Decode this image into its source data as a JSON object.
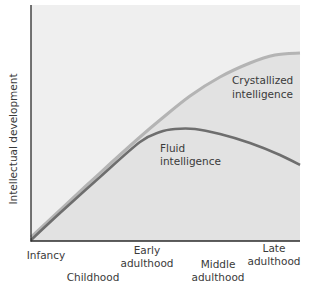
{
  "chart_data": {
    "type": "line",
    "title": "",
    "xlabel": "",
    "ylabel": "Intellectual development",
    "grid": false,
    "legend": "inline annotations",
    "categories": [
      "Infancy",
      "Childhood",
      "Early adulthood",
      "Middle adulthood",
      "Late adulthood"
    ],
    "x_tick_labels": [
      {
        "lines": [
          "Infancy"
        ],
        "x": 46,
        "y": 259
      },
      {
        "lines": [
          "Childhood"
        ],
        "x": 93,
        "y": 281
      },
      {
        "lines": [
          "Early",
          "adulthood"
        ],
        "x": 147,
        "y": 254
      },
      {
        "lines": [
          "Middle",
          "adulthood"
        ],
        "x": 218,
        "y": 268
      },
      {
        "lines": [
          "Late",
          "adulthood"
        ],
        "x": 274,
        "y": 252
      }
    ],
    "ylim": [
      0,
      100
    ],
    "series": [
      {
        "name": "Crystallized intelligence",
        "label_lines": [
          "Crystallized",
          "intelligence"
        ],
        "color": "#b4b4b4",
        "values": [
          2,
          30,
          55,
          78,
          80
        ],
        "points": [
          [
            31,
            237
          ],
          [
            60,
            210
          ],
          [
            100,
            173
          ],
          [
            140,
            137
          ],
          [
            160,
            120
          ],
          [
            190,
            96
          ],
          [
            220,
            77
          ],
          [
            250,
            63
          ],
          [
            275,
            55
          ],
          [
            300,
            53
          ]
        ]
      },
      {
        "name": "Fluid intelligence",
        "label_lines": [
          "Fluid",
          "intelligence"
        ],
        "color": "#6e6e6e",
        "values": [
          1,
          30,
          47,
          44,
          32
        ],
        "points": [
          [
            31,
            240
          ],
          [
            60,
            213
          ],
          [
            100,
            177
          ],
          [
            140,
            142
          ],
          [
            160,
            132
          ],
          [
            175,
            129
          ],
          [
            195,
            129
          ],
          [
            220,
            134
          ],
          [
            250,
            143
          ],
          [
            280,
            155
          ],
          [
            300,
            165
          ]
        ]
      }
    ]
  },
  "colors": {
    "plot_bg": "#efefef",
    "under_curve": "#e0e0e0",
    "axis": "#2a2a2a"
  }
}
